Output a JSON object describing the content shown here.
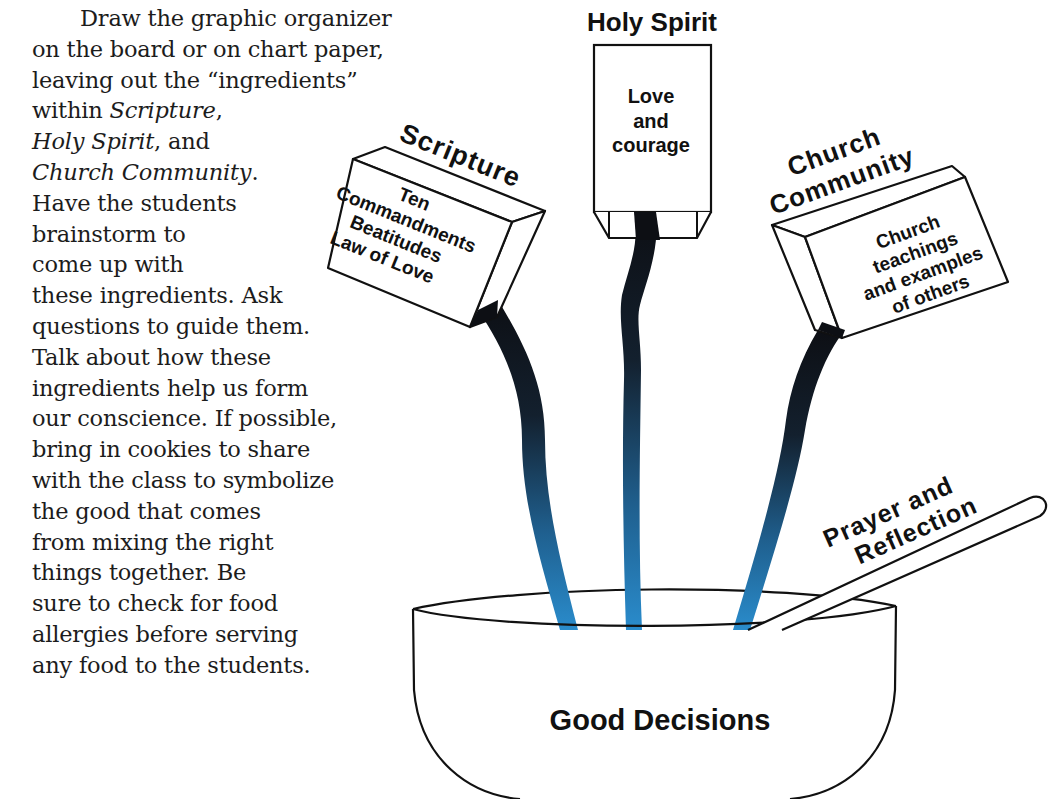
{
  "instructions": {
    "lines": [
      "Draw the graphic organizer",
      "on the board or on chart paper,",
      "leaving out the “ingredients”",
      "within ",
      "Holy Spirit",
      "Church Community",
      "Have the students",
      "brainstorm to",
      "come up with",
      "these ingredients. Ask",
      "questions to guide them.",
      "Talk about how these",
      "ingredients help us form",
      "our conscience. If possible,",
      "bring in cookies to share",
      "with the class to symbolize",
      "the good that comes",
      "from mixing the right",
      "things together. Be",
      "sure to check for food",
      "allergies before serving",
      "any food to the students."
    ],
    "italic_scripture": "Scripture",
    "comma": ",",
    "and_suffix": ", and",
    "period": "."
  },
  "diagram": {
    "holy_spirit": {
      "title": "Holy Spirit",
      "contents": [
        "Love",
        "and",
        "courage"
      ]
    },
    "scripture": {
      "title": "Scripture",
      "contents": [
        "Ten",
        "Commandments",
        "Beatitudes",
        "Law of Love"
      ]
    },
    "church_community": {
      "title_line1": "Church",
      "title_line2": "Community",
      "contents": [
        "Church",
        "teachings",
        "and examples",
        "of others"
      ]
    },
    "spoon": {
      "label_line1": "Prayer and",
      "label_line2": "Reflection"
    },
    "bowl": {
      "label": "Good Decisions"
    },
    "colors": {
      "stream_top": "#0d0f14",
      "stream_bottom": "#2a86c4",
      "outline": "#111111"
    }
  }
}
